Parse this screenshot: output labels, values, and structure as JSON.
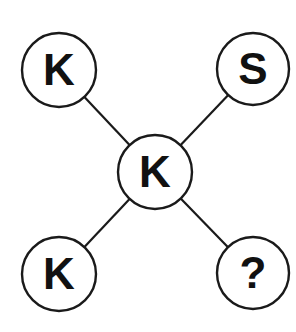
{
  "diagram": {
    "type": "letter-puzzle-graph",
    "center": {
      "id": "center",
      "label": "K",
      "cx": 155,
      "cy": 172,
      "r": 37
    },
    "nodes": [
      {
        "id": "top-left",
        "label": "K",
        "cx": 59,
        "cy": 70,
        "r": 37
      },
      {
        "id": "top-right",
        "label": "S",
        "cx": 253,
        "cy": 69,
        "r": 36
      },
      {
        "id": "bottom-left",
        "label": "K",
        "cx": 59,
        "cy": 274,
        "r": 37
      },
      {
        "id": "bottom-right",
        "label": "?",
        "cx": 253,
        "cy": 273,
        "r": 36
      }
    ],
    "edges": [
      {
        "from": "center",
        "to": "top-left"
      },
      {
        "from": "center",
        "to": "top-right"
      },
      {
        "from": "center",
        "to": "bottom-left"
      },
      {
        "from": "center",
        "to": "bottom-right"
      }
    ],
    "colors": {
      "stroke": "#1a1a1a",
      "fill": "#ffffff",
      "text": "#111111"
    }
  }
}
